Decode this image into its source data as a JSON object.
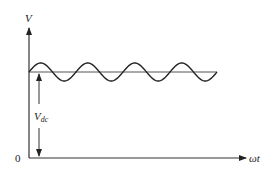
{
  "diagram": {
    "type": "waveform",
    "y_axis_label": "V",
    "x_axis_label": "ωt",
    "origin_label": "0",
    "dc_label_main": "V",
    "dc_label_sub": "dc",
    "waveform": {
      "shape": "sine",
      "periods": 4,
      "dc_level_fraction": 0.65,
      "amplitude_px": 9
    },
    "colors": {
      "line": "#222222",
      "axis": "#333333",
      "dc_line": "#555555",
      "background": "#ffffff"
    }
  }
}
